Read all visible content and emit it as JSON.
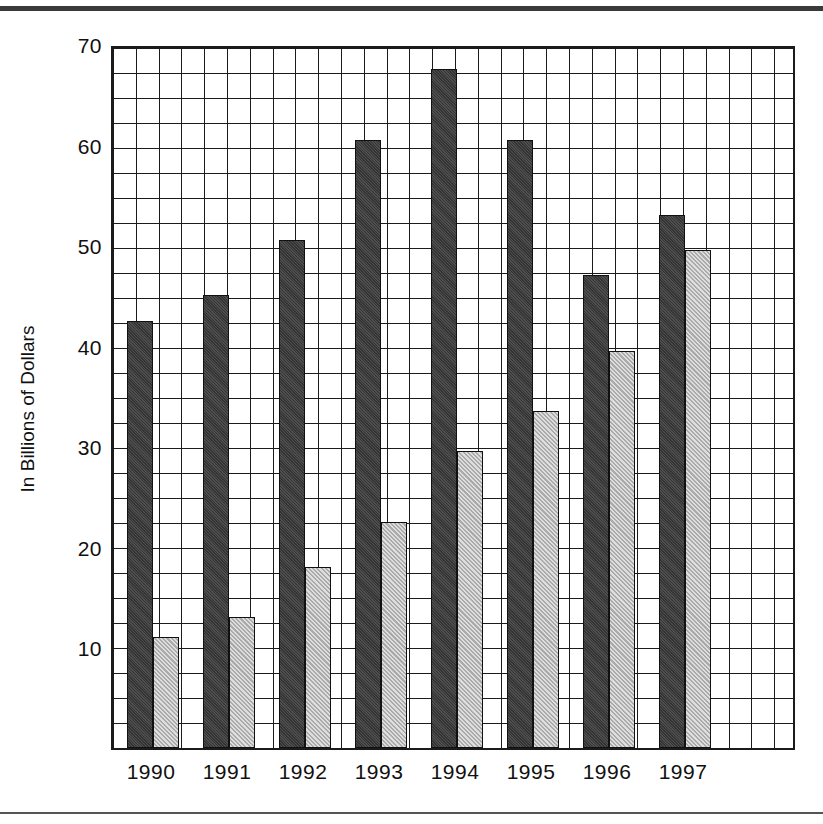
{
  "figure": {
    "background_color": "#ffffff",
    "rule_color": "#3a3a3a"
  },
  "chart_data": {
    "type": "bar",
    "title": "",
    "xlabel": "",
    "ylabel": "In Billions of Dollars",
    "categories": [
      "1990",
      "1991",
      "1992",
      "1993",
      "1994",
      "1995",
      "1996",
      "1997"
    ],
    "series": [
      {
        "name": "series-dark",
        "color": "#434343",
        "values": [
          42.5,
          45.0,
          50.5,
          60.5,
          67.5,
          60.5,
          47.0,
          53.0
        ]
      },
      {
        "name": "series-light",
        "color": "#b5b5b5",
        "values": [
          11.0,
          13.0,
          18.0,
          22.5,
          29.5,
          33.5,
          39.5,
          49.5
        ]
      }
    ],
    "ylim": [
      0,
      70
    ],
    "yticks": [
      "10",
      "20",
      "30",
      "40",
      "50",
      "60",
      "70"
    ],
    "ytick_values": [
      10,
      20,
      30,
      40,
      50,
      60,
      70
    ],
    "grid": true,
    "grid_minor_step": 2.5,
    "legend": "none"
  }
}
